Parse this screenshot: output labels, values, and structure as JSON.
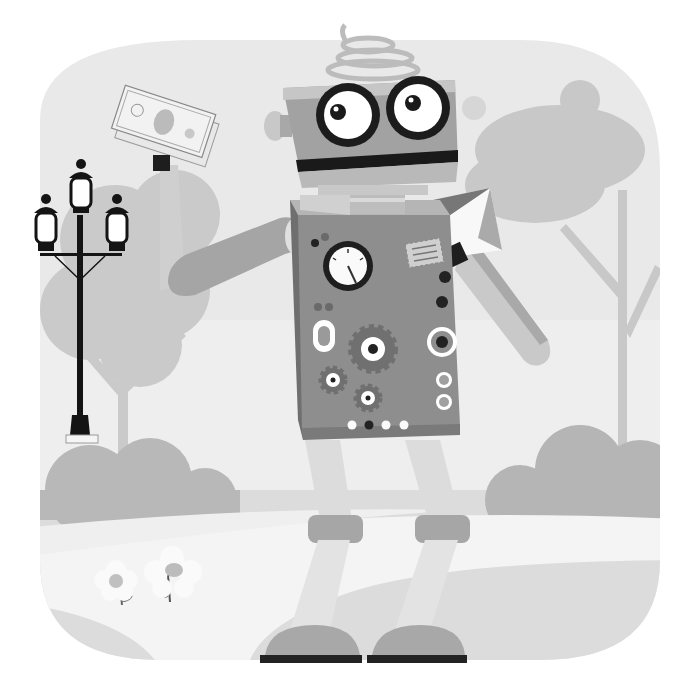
{
  "scene": {
    "title": "Cartoon robot in a park holding money and an envelope",
    "style": "grayscale flat vector illustration",
    "elements": {
      "background": "rounded square vignette with light gray sky",
      "robot": "boxy robot with spring antenna, big round eyes and wide mouth",
      "left_hand_item": "dollar bill",
      "right_hand_item": "envelope / letter",
      "chest_panel": "gauge dial, gears, buttons and rings",
      "lamp": "triple-lantern street lamp",
      "trees": "silhouette trees on both sides",
      "bushes": "rounded bushes at ground level",
      "path": "curving light path",
      "flowers": "two white daisies"
    }
  },
  "colors": {
    "sky": "#e6e6e6",
    "sky_light": "#f1f1f1",
    "tree": "#c8c8c8",
    "bush": "#b5b5b5",
    "ground": "#dadada",
    "path": "#f3f3f3",
    "robot_body": "#8c8c8c",
    "robot_light": "#bdbdbd",
    "robot_mid": "#a3a3a3",
    "dark": "#1e1e1e",
    "white": "#ffffff",
    "lamp": "#141414"
  }
}
